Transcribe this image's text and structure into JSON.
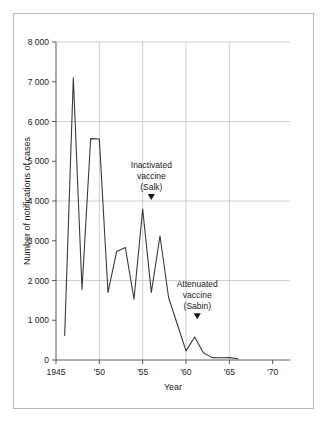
{
  "chart_data": {
    "type": "line",
    "title": "",
    "xlabel": "Year",
    "ylabel": "Number of notifications of cases",
    "xlim": [
      1945,
      1972
    ],
    "ylim": [
      0,
      8000
    ],
    "grid": true,
    "legend": "none",
    "x_tick_values": [
      1945,
      1950,
      1955,
      1960,
      1965,
      1970
    ],
    "x_tick_labels": [
      "1945",
      "'50",
      "'55",
      "'60",
      "'65",
      "'70"
    ],
    "y_tick_values": [
      0,
      1000,
      2000,
      3000,
      4000,
      5000,
      6000,
      7000,
      8000
    ],
    "y_tick_labels": [
      "0",
      "1 000",
      "2 000",
      "3 000",
      "4 000",
      "5 000",
      "6 000",
      "7 000",
      "8 000"
    ],
    "gridlines_x": [
      1950,
      1955,
      1960,
      1965
    ],
    "gridlines_y": [
      2000,
      4000,
      6000,
      8000
    ],
    "x": [
      1946,
      1947,
      1948,
      1949,
      1950,
      1951,
      1952,
      1953,
      1954,
      1955,
      1956,
      1957,
      1958,
      1959,
      1960,
      1961,
      1962,
      1963,
      1964,
      1965,
      1966
    ],
    "values": [
      620,
      7100,
      1780,
      5570,
      5560,
      1700,
      2730,
      2830,
      1530,
      3800,
      1700,
      3120,
      1560,
      900,
      230,
      580,
      180,
      60,
      55,
      60,
      30
    ],
    "series": [
      {
        "name": "Notifications of cases",
        "values": [
          620,
          7100,
          1780,
          5570,
          5560,
          1700,
          2730,
          2830,
          1530,
          3800,
          1700,
          3120,
          1560,
          900,
          230,
          580,
          180,
          60,
          55,
          60,
          30
        ]
      }
    ],
    "annotations": [
      {
        "id": "salk",
        "lines": [
          "Inactivated",
          "vaccine",
          "(Salk)"
        ],
        "marker": "down-triangle",
        "x": 1956,
        "y": 4000
      },
      {
        "id": "sabin",
        "lines": [
          "Attenuated",
          "vaccine",
          "(Sabin)"
        ],
        "marker": "down-triangle",
        "x": 1961.3,
        "y": 1000
      }
    ]
  },
  "colors": {
    "line": "#3a3a3a",
    "grid": "#c3c3c3",
    "axis": "#5a5a5a",
    "frame": "#b9b9b9",
    "text": "#1a1a1a",
    "background": "#ffffff"
  }
}
